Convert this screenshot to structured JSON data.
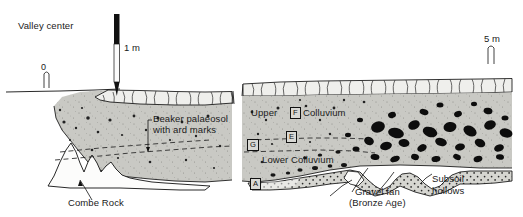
{
  "figure": {
    "type": "archaeological-section-drawing",
    "title_label": "Valley center",
    "background_color": "#ffffff",
    "colluvium_fill": "#c9c9c4",
    "subsoil_fill": "#d4d4cf",
    "clast_color": "#111111",
    "line_color": "#111111"
  },
  "labels": {
    "valley_center": "Valley center",
    "beaker_palaeosol_line1": "Beaker palaeosol",
    "beaker_palaeosol_line2": "with ard marks",
    "upper": "Upper",
    "colluvium": "Colluvium",
    "lower_colluvium": "Lower Colluvium",
    "combe_rock": "Combe Rock",
    "gravel_fan_line1": "Gravel fan",
    "gravel_fan_line2": "(Bronze Age)",
    "subsoil_line1": "Subsoil",
    "subsoil_line2": "hollows"
  },
  "context_boxes": {
    "f": "F",
    "e": "E",
    "g": "G",
    "a": "A"
  },
  "scales": {
    "vertical_rod_label": "1 m",
    "origin_label": "0",
    "horizontal_label": "5 m"
  }
}
